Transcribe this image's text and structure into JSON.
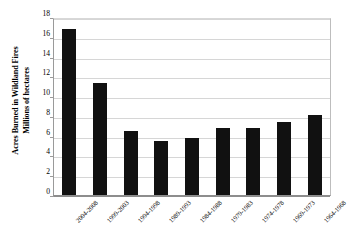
{
  "chart_data": {
    "type": "bar",
    "title": "",
    "xlabel": "",
    "ylabel": "Acres Burned in Wildland Fires Millions of hectares",
    "ylabel_lines": [
      "Acres Burned in Wildland Fires",
      "Millions of hectares"
    ],
    "ylim": [
      0,
      18
    ],
    "ytick_step": 2,
    "yticks": [
      18,
      16,
      14,
      12,
      10,
      8,
      6,
      4,
      2,
      0
    ],
    "ytick_labels": [
      "18",
      "16",
      "14",
      "12",
      "10",
      "8",
      "6",
      "4",
      "2",
      "0"
    ],
    "grid": true,
    "grid_axis": "y",
    "legend": false,
    "legend_position": "none",
    "bar_color": "#111111",
    "gridline_color": "#d6d6d6",
    "axis_color": "#8d8d8d",
    "categories": [
      "2004-2008",
      "1999-2003",
      "1994-1998",
      "1989-1993",
      "1984-1988",
      "1979-1983",
      "1974-1978",
      "1969-1973",
      "1964-1968"
    ],
    "values": [
      16.8,
      11.3,
      6.5,
      5.5,
      5.8,
      6.8,
      6.8,
      7.4,
      8.1
    ]
  }
}
